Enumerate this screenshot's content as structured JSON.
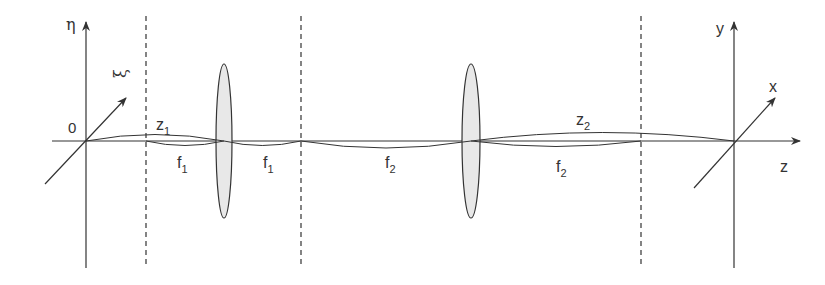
{
  "diagram": {
    "type": "optical 4f-like two-lens system",
    "colors": {
      "line": "#333333",
      "lens_fill": "#e8e8e8",
      "background": "#ffffff"
    },
    "input_plane": {
      "origin_label": "0",
      "vertical_axis_label": "η",
      "oblique_axis_label": "ξ"
    },
    "output_plane": {
      "vertical_axis_label": "y",
      "oblique_axis_label": "x",
      "optical_axis_label": "z"
    },
    "distances": {
      "z1": {
        "base": "z",
        "sub": "1"
      },
      "f1_a": {
        "base": "f",
        "sub": "1"
      },
      "f1_b": {
        "base": "f",
        "sub": "1"
      },
      "f2_a": {
        "base": "f",
        "sub": "2"
      },
      "z2": {
        "base": "z",
        "sub": "2"
      },
      "f2_b": {
        "base": "f",
        "sub": "2"
      }
    },
    "lenses": [
      "lens-1",
      "lens-2"
    ],
    "planes": [
      "front-focal-plane-1",
      "fourier-plane",
      "back-focal-plane-2"
    ]
  }
}
